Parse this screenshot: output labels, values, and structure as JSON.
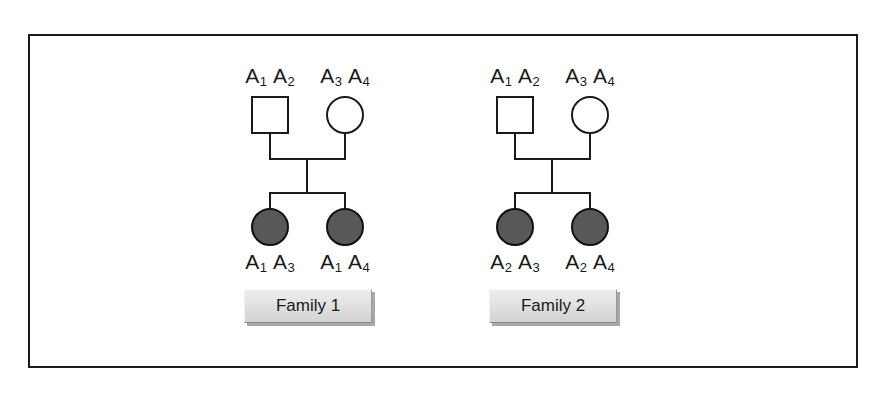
{
  "figure": {
    "frame_color": "#1a1a1a",
    "background": "#ffffff",
    "affected_fill": "#585858"
  },
  "families": [
    {
      "label": "Family 1",
      "father": {
        "symbol": "square",
        "affected": false,
        "alleles": [
          {
            "locus": "A",
            "number": "1"
          },
          {
            "locus": "A",
            "number": "2"
          }
        ]
      },
      "mother": {
        "symbol": "circle",
        "affected": false,
        "alleles": [
          {
            "locus": "A",
            "number": "3"
          },
          {
            "locus": "A",
            "number": "4"
          }
        ]
      },
      "children": [
        {
          "symbol": "circle",
          "affected": true,
          "alleles": [
            {
              "locus": "A",
              "number": "1"
            },
            {
              "locus": "A",
              "number": "3"
            }
          ]
        },
        {
          "symbol": "circle",
          "affected": true,
          "alleles": [
            {
              "locus": "A",
              "number": "1"
            },
            {
              "locus": "A",
              "number": "4"
            }
          ]
        }
      ]
    },
    {
      "label": "Family 2",
      "father": {
        "symbol": "square",
        "affected": false,
        "alleles": [
          {
            "locus": "A",
            "number": "1"
          },
          {
            "locus": "A",
            "number": "2"
          }
        ]
      },
      "mother": {
        "symbol": "circle",
        "affected": false,
        "alleles": [
          {
            "locus": "A",
            "number": "3"
          },
          {
            "locus": "A",
            "number": "4"
          }
        ]
      },
      "children": [
        {
          "symbol": "circle",
          "affected": true,
          "alleles": [
            {
              "locus": "A",
              "number": "2"
            },
            {
              "locus": "A",
              "number": "3"
            }
          ]
        },
        {
          "symbol": "circle",
          "affected": true,
          "alleles": [
            {
              "locus": "A",
              "number": "2"
            },
            {
              "locus": "A",
              "number": "4"
            }
          ]
        }
      ]
    }
  ]
}
